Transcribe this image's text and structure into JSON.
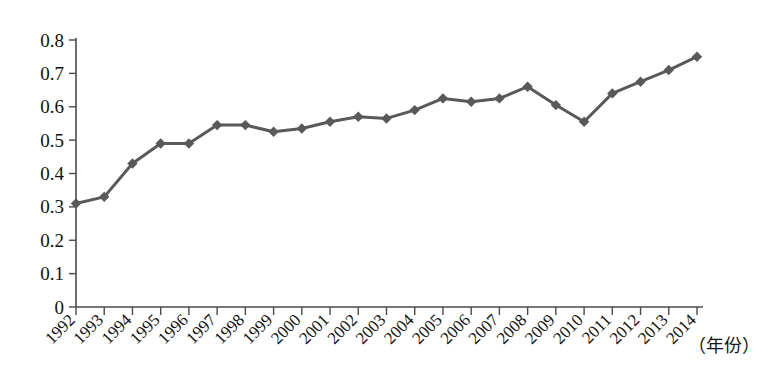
{
  "chart_data": {
    "type": "line",
    "title": "",
    "subtitle": "",
    "xlabel": "（年份）",
    "ylabel": "",
    "categories": [
      "1992",
      "1993",
      "1994",
      "1995",
      "1996",
      "1997",
      "1998",
      "1999",
      "2000",
      "2001",
      "2002",
      "2003",
      "2004",
      "2005",
      "2006",
      "2007",
      "2008",
      "2009",
      "2010",
      "2011",
      "2012",
      "2013",
      "2014"
    ],
    "values": [
      0.31,
      0.33,
      0.43,
      0.49,
      0.49,
      0.545,
      0.545,
      0.525,
      0.535,
      0.555,
      0.57,
      0.565,
      0.59,
      0.625,
      0.615,
      0.625,
      0.66,
      0.605,
      0.555,
      0.64,
      0.675,
      0.71,
      0.75
    ],
    "series": [
      {
        "name": "series-1",
        "values": [
          0.31,
          0.33,
          0.43,
          0.49,
          0.49,
          0.545,
          0.545,
          0.525,
          0.535,
          0.555,
          0.57,
          0.565,
          0.59,
          0.625,
          0.615,
          0.625,
          0.66,
          0.605,
          0.555,
          0.64,
          0.675,
          0.71,
          0.75
        ],
        "color": "#595959",
        "marker": "diamond"
      }
    ],
    "ylim": [
      0,
      0.8
    ],
    "yticks": [
      0,
      0.1,
      0.2,
      0.3,
      0.4,
      0.5,
      0.6,
      0.7,
      0.8
    ],
    "ytick_labels": [
      "0",
      "0.1",
      "0.2",
      "0.3",
      "0.4",
      "0.5",
      "0.6",
      "0.7",
      "0.8"
    ],
    "grid": false,
    "legend": null,
    "legend_position": "none",
    "annotations": []
  },
  "axis": {
    "x_title": "（年份）",
    "y_title": ""
  },
  "colors": {
    "series": "#595959",
    "axis": "#4a4a4a",
    "text": "#111111",
    "background": "#ffffff"
  }
}
